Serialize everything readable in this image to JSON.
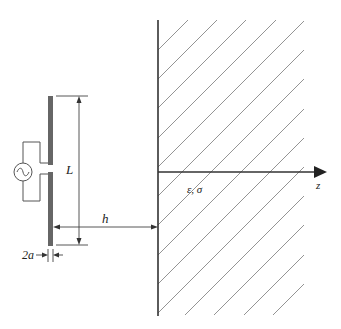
{
  "figure": {
    "colors": {
      "line": "#333333",
      "hatch": "#888888",
      "rod": "#666666",
      "background": "#ffffff"
    },
    "labels": {
      "length": "L",
      "height": "h",
      "diameter": "2a",
      "medium": "ε, σ",
      "axis": "z"
    },
    "icons": {
      "source": "ac-voltage-source-icon"
    }
  }
}
